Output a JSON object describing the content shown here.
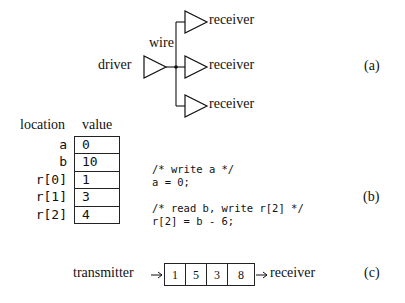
{
  "panel_a": {
    "tag": "(a)",
    "driver_label": "driver",
    "wire_label": "wire",
    "receivers": [
      "receiver",
      "receiver",
      "receiver"
    ]
  },
  "panel_b": {
    "tag": "(b)",
    "header_location": "location",
    "header_value": "value",
    "memory": [
      {
        "location": "a",
        "value": "0"
      },
      {
        "location": "b",
        "value": "10"
      },
      {
        "location": "r[0]",
        "value": "1"
      },
      {
        "location": "r[1]",
        "value": "3"
      },
      {
        "location": "r[2]",
        "value": "4"
      }
    ],
    "code": [
      "/* write a */",
      "a = 0;",
      "",
      "/* read b, write r[2] */",
      "r[2] = b - 6;"
    ]
  },
  "panel_c": {
    "tag": "(c)",
    "transmitter_label": "transmitter",
    "receiver_label": "receiver",
    "queue": [
      "1",
      "5",
      "3",
      "8"
    ]
  }
}
